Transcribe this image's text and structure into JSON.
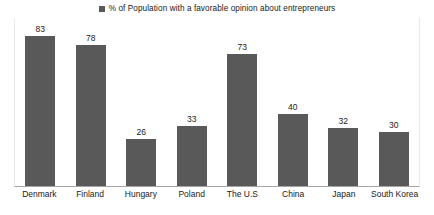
{
  "legend": {
    "marker_icon": "legend-square-marker",
    "label": "% of Population with a favorable opinion about entrepreneurs",
    "position": "top-center"
  },
  "colors": {
    "bar": "#595959",
    "axis_line": "#a6a6a6",
    "plot_border": "#e8e8e8",
    "text": "#1a1a1a",
    "background": "#ffffff"
  },
  "chart_data": {
    "type": "bar",
    "title": "",
    "subtitle": "",
    "xlabel": "",
    "ylabel": "",
    "categories": [
      "Denmark",
      "Finland",
      "Hungary",
      "Poland",
      "The U.S",
      "China",
      "Japan",
      "South Korea"
    ],
    "values": [
      83,
      78,
      26,
      33,
      73,
      40,
      32,
      30
    ],
    "series": [
      {
        "name": "% of Population with a favorable opinion about entrepreneurs",
        "values": [
          83,
          78,
          26,
          33,
          73,
          40,
          32,
          30
        ],
        "color": "#595959"
      }
    ],
    "data_labels": [
      "83",
      "78",
      "26",
      "33",
      "73",
      "40",
      "32",
      "30"
    ],
    "ylim": [
      0,
      93
    ],
    "grid": false,
    "y_axis_visible": false,
    "y_ticks": [],
    "legend_position": "top-center",
    "orientation": "vertical"
  }
}
